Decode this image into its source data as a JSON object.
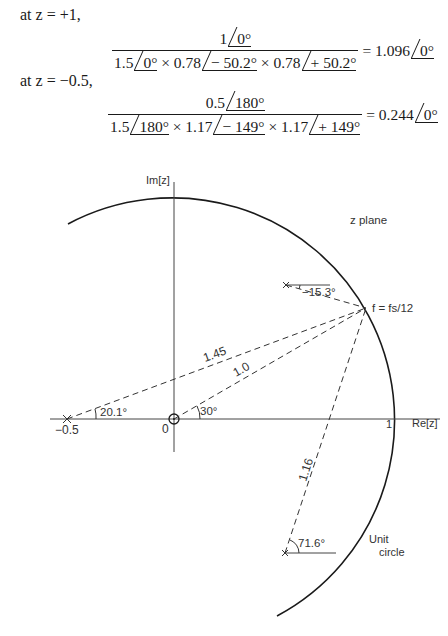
{
  "equations": [
    {
      "condition": "at z = +1,",
      "numerator": {
        "mag": "1",
        "angle": "0°"
      },
      "denominator": [
        {
          "mag": "1.5",
          "angle": "0°"
        },
        {
          "sep": "×",
          "mag": "0.78",
          "angle": "− 50.2°"
        },
        {
          "sep": "×",
          "mag": "0.78",
          "angle": "+ 50.2°"
        }
      ],
      "result": {
        "mag": "1.096",
        "angle": "0°"
      }
    },
    {
      "condition": "at z = −0.5,",
      "numerator": {
        "mag": "0.5",
        "angle": "180°"
      },
      "denominator": [
        {
          "mag": "1.5",
          "angle": "180°"
        },
        {
          "sep": "×",
          "mag": "1.17",
          "angle": "− 149°"
        },
        {
          "sep": "×",
          "mag": "1.17",
          "angle": "+ 149°"
        }
      ],
      "result": {
        "mag": "0.244",
        "angle": "0°"
      }
    }
  ],
  "diagram": {
    "imag_axis_label": "Im[z]",
    "real_axis_label": "Re[z]",
    "plane_label": "z plane",
    "unit_circle_label_line1": "Unit",
    "unit_circle_label_line2": "circle",
    "origin_label": "0",
    "one_label": "1",
    "minus_half_label": "−0.5",
    "point_label": "f = fs/12",
    "vector_labels": {
      "from_minus_half": "1.45",
      "from_origin": "1.0",
      "from_lower_pole": "1.16"
    },
    "angle_labels": {
      "minus_half": "20.1°",
      "origin": "30°",
      "upper_pole": "−15.3°",
      "lower_pole": "71.6°"
    },
    "colors": {
      "ink": "#1a1a1a",
      "dash": "#333333",
      "background": "#ffffff"
    }
  }
}
